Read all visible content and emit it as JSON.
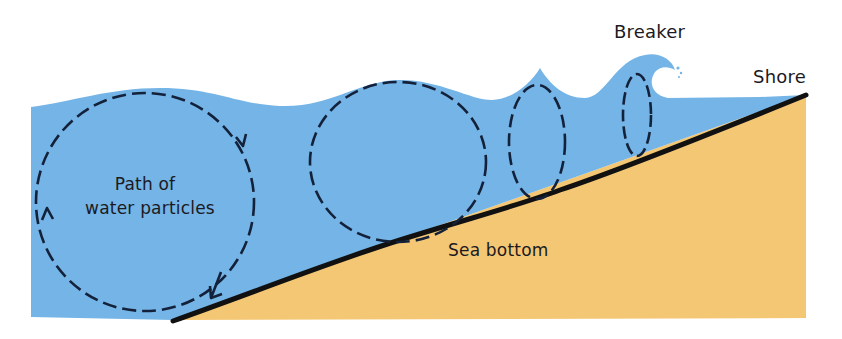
{
  "diagram": {
    "labels": {
      "breaker": "Breaker",
      "shore": "Shore",
      "path_line1": "Path of",
      "path_line2": "water particles",
      "sea_bottom": "Sea bottom"
    },
    "colors": {
      "water": "#74b4e6",
      "sand": "#f4c774",
      "sea_floor_line": "#111111",
      "orbit_dash": "#14213a",
      "text": "#1c1a1f",
      "background": "#ffffff"
    },
    "orbits": [
      {
        "name": "deep-water-circular-orbit",
        "cx": 145,
        "cy": 202,
        "rx": 109,
        "ry": 109,
        "arrows": 3
      },
      {
        "name": "shoaling-elliptical-orbit",
        "cx": 398,
        "cy": 162,
        "rx": 88,
        "ry": 80,
        "arrows": 0
      },
      {
        "name": "steep-elliptical-orbit",
        "cx": 537,
        "cy": 142,
        "rx": 28,
        "ry": 58,
        "arrows": 0
      },
      {
        "name": "breaker-elliptical-orbit",
        "cx": 637,
        "cy": 115,
        "rx": 14,
        "ry": 42,
        "arrows": 0
      }
    ]
  }
}
